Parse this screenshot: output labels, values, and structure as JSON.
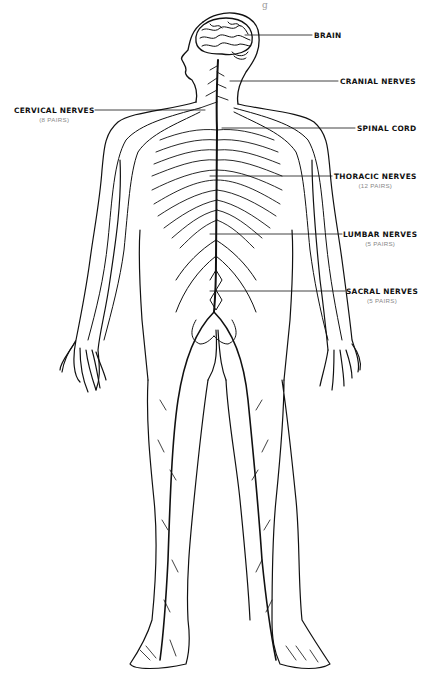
{
  "top_fragment": "g",
  "figure": {
    "line_color": "#111111",
    "background": "#ffffff"
  },
  "labels": {
    "brain": {
      "title": "BRAIN"
    },
    "cranial": {
      "title": "CRANIAL NERVES"
    },
    "cervical": {
      "title": "CERVICAL NERVES",
      "sub": "(8 PAIRS)"
    },
    "spinal": {
      "title": "SPINAL CORD"
    },
    "thoracic": {
      "title": "THORACIC NERVES",
      "sub": "(12 PAIRS)"
    },
    "lumbar": {
      "title": "LUMBAR NERVES",
      "sub": "(5 PAIRS)"
    },
    "sacral": {
      "title": "SACRAL NERVES",
      "sub": "(5 PAIRS)"
    }
  }
}
